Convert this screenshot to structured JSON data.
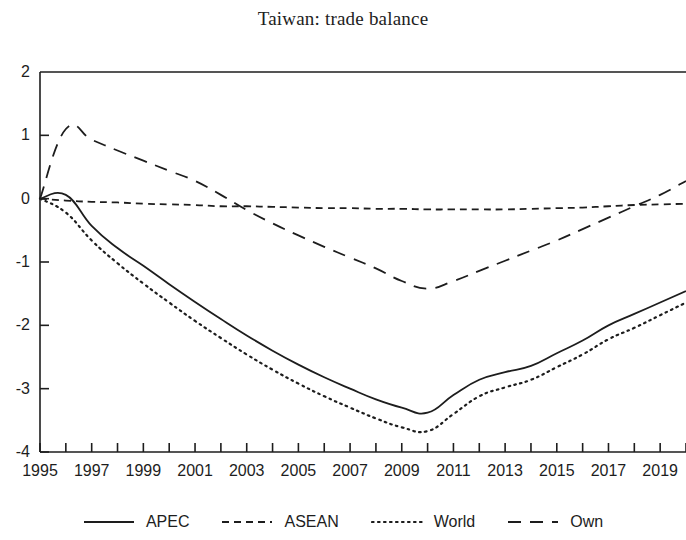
{
  "chart_data": {
    "type": "line",
    "title": "Taiwan: trade balance",
    "xlabel": "",
    "ylabel": "",
    "xlim": [
      1995,
      2020
    ],
    "ylim": [
      -4,
      2
    ],
    "yticks": [
      2,
      1,
      0,
      -1,
      -2,
      -3,
      -4
    ],
    "ytick_labels": [
      "2",
      "1",
      "0",
      "-1",
      "-2",
      "-3",
      "-4"
    ],
    "xticks": [
      1995,
      1996,
      1997,
      1998,
      1999,
      2000,
      2001,
      2002,
      2003,
      2004,
      2005,
      2006,
      2007,
      2008,
      2009,
      2010,
      2011,
      2012,
      2013,
      2014,
      2015,
      2016,
      2017,
      2018,
      2019,
      2020
    ],
    "xtick_labels_shown": [
      "1995",
      "1997",
      "1999",
      "2001",
      "2003",
      "2005",
      "2007",
      "2009",
      "2011",
      "2013",
      "2015",
      "2017",
      "2019"
    ],
    "grid": false,
    "legend_position": "bottom",
    "x": [
      1995,
      1996,
      1997,
      1998,
      1999,
      2000,
      2001,
      2002,
      2003,
      2004,
      2005,
      2006,
      2007,
      2008,
      2009,
      2010,
      2011,
      2012,
      2013,
      2014,
      2015,
      2016,
      2017,
      2018,
      2019,
      2020
    ],
    "series": [
      {
        "name": "APEC",
        "style": "solid",
        "color": "#1d1d1d",
        "values": [
          0.0,
          0.06,
          -0.43,
          -0.78,
          -1.06,
          -1.35,
          -1.63,
          -1.9,
          -2.16,
          -2.4,
          -2.62,
          -2.82,
          -3.0,
          -3.17,
          -3.3,
          -3.38,
          -3.1,
          -2.86,
          -2.74,
          -2.64,
          -2.44,
          -2.24,
          -2.0,
          -1.82,
          -1.64,
          -1.46
        ]
      },
      {
        "name": "ASEAN",
        "style": "dashed",
        "color": "#1d1d1d",
        "values": [
          0.0,
          -0.03,
          -0.05,
          -0.06,
          -0.08,
          -0.09,
          -0.1,
          -0.12,
          -0.12,
          -0.13,
          -0.14,
          -0.15,
          -0.15,
          -0.16,
          -0.16,
          -0.17,
          -0.17,
          -0.17,
          -0.17,
          -0.16,
          -0.15,
          -0.14,
          -0.12,
          -0.1,
          -0.09,
          -0.08
        ]
      },
      {
        "name": "World",
        "style": "dotted",
        "color": "#1d1d1d",
        "values": [
          0.0,
          -0.22,
          -0.66,
          -1.02,
          -1.34,
          -1.64,
          -1.93,
          -2.2,
          -2.46,
          -2.7,
          -2.92,
          -3.12,
          -3.3,
          -3.47,
          -3.61,
          -3.67,
          -3.4,
          -3.12,
          -2.98,
          -2.86,
          -2.66,
          -2.46,
          -2.22,
          -2.04,
          -1.84,
          -1.64
        ]
      },
      {
        "name": "Own",
        "style": "longdash",
        "color": "#1d1d1d",
        "values": [
          0.0,
          1.1,
          0.93,
          0.76,
          0.6,
          0.44,
          0.28,
          0.06,
          -0.18,
          -0.39,
          -0.58,
          -0.76,
          -0.93,
          -1.1,
          -1.3,
          -1.42,
          -1.3,
          -1.14,
          -0.98,
          -0.82,
          -0.66,
          -0.48,
          -0.3,
          -0.12,
          0.06,
          0.28
        ]
      }
    ],
    "legend": [
      {
        "label": "APEC",
        "style": "solid"
      },
      {
        "label": "ASEAN",
        "style": "dashed"
      },
      {
        "label": "World",
        "style": "dotted"
      },
      {
        "label": "Own",
        "style": "longdash"
      }
    ]
  }
}
